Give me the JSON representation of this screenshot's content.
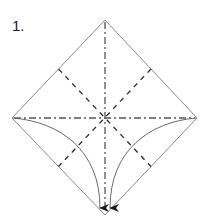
{
  "step": {
    "label": "1."
  },
  "diagram": {
    "type": "origami-fold-diagram",
    "shape": "square-rotated-45",
    "vertices": {
      "top": [
        105,
        20
      ],
      "right": [
        197,
        118
      ],
      "bottom": [
        105,
        215
      ],
      "left": [
        12,
        118
      ],
      "center": [
        105,
        118
      ]
    },
    "lines": {
      "outline": {
        "style": "solid",
        "color": "#8a8a8a"
      },
      "mountain_folds": {
        "style": "dash-dot",
        "color": "#555555",
        "segments": [
          "vertical-diagonal",
          "horizontal-diagonal"
        ]
      },
      "valley_folds": {
        "style": "dashed",
        "color": "#333333",
        "segments": [
          "edge-midpoint-ul-to-lr",
          "edge-midpoint-ur-to-ll"
        ]
      }
    },
    "arrows": [
      {
        "name": "left-corner-to-bottom",
        "from": "left",
        "to": "bottom",
        "color": "#555555"
      },
      {
        "name": "right-corner-to-bottom",
        "from": "right",
        "to": "bottom",
        "color": "#555555"
      }
    ]
  }
}
